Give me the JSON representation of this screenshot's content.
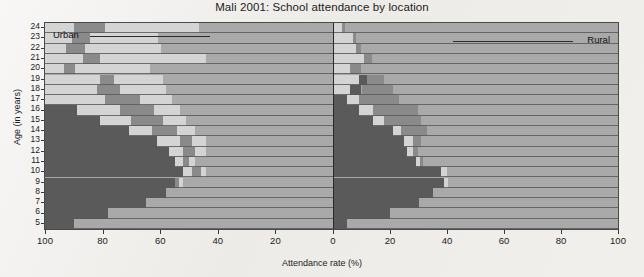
{
  "chart_data": {
    "type": "bar",
    "subtype": "diverging-stacked-bar-pyramid",
    "title": "Mali 2001: School attendance by location",
    "xlabel": "Attendance rate (%)",
    "ylabel": "Age (in years)",
    "grid": false,
    "legend_position": "in-plot-annotation",
    "annotations": [
      {
        "text": "Urban",
        "side": "left"
      },
      {
        "text": "Rural",
        "side": "right"
      }
    ],
    "x_ticks_left": [
      "100",
      "80",
      "60",
      "40",
      "20",
      "0"
    ],
    "x_ticks_right": [
      "0",
      "20",
      "40",
      "60",
      "80",
      "100"
    ],
    "x_tick_values_left": [
      100,
      80,
      60,
      40,
      20,
      0
    ],
    "x_tick_values_right": [
      0,
      20,
      40,
      60,
      80,
      100
    ],
    "xlim_left": [
      0,
      100
    ],
    "xlim_right": [
      0,
      100
    ],
    "categories": [
      "24",
      "23",
      "22",
      "21",
      "20",
      "19",
      "18",
      "17",
      "16",
      "15",
      "14",
      "13",
      "12",
      "11",
      "10",
      "9",
      "8",
      "7",
      "6",
      "5"
    ],
    "series": [
      {
        "name": "never attended",
        "color": "#a9a9a9"
      },
      {
        "name": "left school",
        "color": "#d4d4d4"
      },
      {
        "name": "attending (secondary/other)",
        "color": "#8a8a8a"
      },
      {
        "name": "attending primary",
        "color": "#5a5a5a"
      }
    ],
    "colors": {
      "never_attended": "#a9a9a9",
      "left_school": "#d4d4d4",
      "attending_other": "#8a8a8a",
      "attending_primary": "#5a5a5a",
      "plot_background": "#a9a9a9",
      "axis": "#3a3a3a",
      "page_background": "#efedea"
    },
    "rows": [
      {
        "age": "24",
        "left": [
          {
            "c": "never_attended",
            "v": 46.5
          },
          {
            "c": "left_school",
            "v": 32.6
          },
          {
            "c": "attending_other",
            "v": 10.8
          },
          {
            "c": "attending_primary",
            "v": 0
          },
          {
            "c": "left_school",
            "v": 10.1
          }
        ],
        "right": [
          {
            "c": "left_school",
            "v": 3.3
          },
          {
            "c": "attending_other",
            "v": 1.0
          },
          {
            "c": "never_attended",
            "v": 95.7
          }
        ]
      },
      {
        "age": "23",
        "left": [
          {
            "c": "never_attended",
            "v": 60.8
          },
          {
            "c": "left_school",
            "v": 23.6
          },
          {
            "c": "attending_other",
            "v": 6.3
          },
          {
            "c": "left_school",
            "v": 9.3
          }
        ],
        "right": [
          {
            "c": "left_school",
            "v": 7.0
          },
          {
            "c": "attending_other",
            "v": 1.2
          },
          {
            "c": "never_attended",
            "v": 91.8
          }
        ]
      },
      {
        "age": "22",
        "left": [
          {
            "c": "never_attended",
            "v": 59.7
          },
          {
            "c": "left_school",
            "v": 26.4
          },
          {
            "c": "attending_other",
            "v": 6.6
          },
          {
            "c": "left_school",
            "v": 7.3
          }
        ],
        "right": [
          {
            "c": "left_school",
            "v": 8.0
          },
          {
            "c": "attending_other",
            "v": 2.0
          },
          {
            "c": "never_attended",
            "v": 90.0
          }
        ]
      },
      {
        "age": "21",
        "left": [
          {
            "c": "never_attended",
            "v": 44.1
          },
          {
            "c": "left_school",
            "v": 36.8
          },
          {
            "c": "attending_other",
            "v": 5.9
          },
          {
            "c": "left_school",
            "v": 13.2
          }
        ],
        "right": [
          {
            "c": "left_school",
            "v": 11.0
          },
          {
            "c": "attending_other",
            "v": 2.6
          },
          {
            "c": "never_attended",
            "v": 86.4
          }
        ]
      },
      {
        "age": "20",
        "left": [
          {
            "c": "never_attended",
            "v": 63.5
          },
          {
            "c": "left_school",
            "v": 26.0
          },
          {
            "c": "attending_other",
            "v": 3.8
          },
          {
            "c": "left_school",
            "v": 6.7
          }
        ],
        "right": [
          {
            "c": "left_school",
            "v": 6.0
          },
          {
            "c": "attending_other",
            "v": 4.0
          },
          {
            "c": "never_attended",
            "v": 90.0
          }
        ]
      },
      {
        "age": "19",
        "left": [
          {
            "c": "never_attended",
            "v": 59.0
          },
          {
            "c": "left_school",
            "v": 17.0
          },
          {
            "c": "attending_other",
            "v": 5.0
          },
          {
            "c": "left_school",
            "v": 19.0
          }
        ],
        "right": [
          {
            "c": "left_school",
            "v": 9.0
          },
          {
            "c": "attending_primary",
            "v": 3.0
          },
          {
            "c": "attending_other",
            "v": 6.0
          },
          {
            "c": "never_attended",
            "v": 82.0
          }
        ]
      },
      {
        "age": "18",
        "left": [
          {
            "c": "never_attended",
            "v": 58.0
          },
          {
            "c": "left_school",
            "v": 16.0
          },
          {
            "c": "attending_other",
            "v": 8.0
          },
          {
            "c": "left_school",
            "v": 18.0
          }
        ],
        "right": [
          {
            "c": "left_school",
            "v": 6.0
          },
          {
            "c": "attending_primary",
            "v": 4.0
          },
          {
            "c": "attending_other",
            "v": 11.0
          },
          {
            "c": "never_attended",
            "v": 79.0
          }
        ]
      },
      {
        "age": "17",
        "left": [
          {
            "c": "never_attended",
            "v": 56.0
          },
          {
            "c": "left_school",
            "v": 11.0
          },
          {
            "c": "attending_other",
            "v": 12.0
          },
          {
            "c": "left_school",
            "v": 21.0
          }
        ],
        "right": [
          {
            "c": "attending_primary",
            "v": 5.0
          },
          {
            "c": "left_school",
            "v": 4.0
          },
          {
            "c": "attending_other",
            "v": 14.0
          },
          {
            "c": "never_attended",
            "v": 77.0
          }
        ]
      },
      {
        "age": "16",
        "left": [
          {
            "c": "never_attended",
            "v": 53.0
          },
          {
            "c": "left_school",
            "v": 9.0
          },
          {
            "c": "attending_other",
            "v": 12.0
          },
          {
            "c": "left_school",
            "v": 15.0
          },
          {
            "c": "attending_primary",
            "v": 11.0
          }
        ],
        "right": [
          {
            "c": "attending_primary",
            "v": 9.0
          },
          {
            "c": "left_school",
            "v": 5.0
          },
          {
            "c": "attending_other",
            "v": 16.0
          },
          {
            "c": "never_attended",
            "v": 70.0
          }
        ]
      },
      {
        "age": "15",
        "left": [
          {
            "c": "never_attended",
            "v": 51.0
          },
          {
            "c": "left_school",
            "v": 8.0
          },
          {
            "c": "attending_other",
            "v": 11.0
          },
          {
            "c": "left_school",
            "v": 11.0
          },
          {
            "c": "attending_primary",
            "v": 19.0
          }
        ],
        "right": [
          {
            "c": "attending_primary",
            "v": 14.0
          },
          {
            "c": "left_school",
            "v": 4.0
          },
          {
            "c": "attending_other",
            "v": 13.0
          },
          {
            "c": "never_attended",
            "v": 69.0
          }
        ]
      },
      {
        "age": "14",
        "left": [
          {
            "c": "never_attended",
            "v": 48.0
          },
          {
            "c": "left_school",
            "v": 6.0
          },
          {
            "c": "attending_other",
            "v": 9.0
          },
          {
            "c": "left_school",
            "v": 8.0
          },
          {
            "c": "attending_primary",
            "v": 29.0
          }
        ],
        "right": [
          {
            "c": "attending_primary",
            "v": 21.0
          },
          {
            "c": "left_school",
            "v": 3.0
          },
          {
            "c": "attending_other",
            "v": 9.0
          },
          {
            "c": "never_attended",
            "v": 67.0
          }
        ]
      },
      {
        "age": "13",
        "left": [
          {
            "c": "never_attended",
            "v": 44.0
          },
          {
            "c": "left_school",
            "v": 5.0
          },
          {
            "c": "attending_other",
            "v": 4.0
          },
          {
            "c": "left_school",
            "v": 8.0
          },
          {
            "c": "attending_primary",
            "v": 39.0
          }
        ],
        "right": [
          {
            "c": "attending_primary",
            "v": 25.0
          },
          {
            "c": "left_school",
            "v": 3.0
          },
          {
            "c": "attending_other",
            "v": 3.0
          },
          {
            "c": "never_attended",
            "v": 69.0
          }
        ]
      },
      {
        "age": "12",
        "left": [
          {
            "c": "never_attended",
            "v": 44.0
          },
          {
            "c": "left_school",
            "v": 4.0
          },
          {
            "c": "attending_other",
            "v": 4.0
          },
          {
            "c": "left_school",
            "v": 5.0
          },
          {
            "c": "attending_primary",
            "v": 43.0
          }
        ],
        "right": [
          {
            "c": "attending_primary",
            "v": 26.0
          },
          {
            "c": "left_school",
            "v": 2.0
          },
          {
            "c": "attending_other",
            "v": 2.0
          },
          {
            "c": "never_attended",
            "v": 70.0
          }
        ]
      },
      {
        "age": "11",
        "left": [
          {
            "c": "never_attended",
            "v": 48.0
          },
          {
            "c": "left_school",
            "v": 2.0
          },
          {
            "c": "attending_other",
            "v": 2.0
          },
          {
            "c": "left_school",
            "v": 3.0
          },
          {
            "c": "attending_primary",
            "v": 45.0
          }
        ],
        "right": [
          {
            "c": "attending_primary",
            "v": 29.0
          },
          {
            "c": "left_school",
            "v": 1.5
          },
          {
            "c": "attending_other",
            "v": 1.0
          },
          {
            "c": "never_attended",
            "v": 68.5
          }
        ]
      },
      {
        "age": "10",
        "left": [
          {
            "c": "never_attended",
            "v": 44.0
          },
          {
            "c": "left_school",
            "v": 2.0
          },
          {
            "c": "attending_other",
            "v": 3.0
          },
          {
            "c": "left_school",
            "v": 3.0
          },
          {
            "c": "attending_primary",
            "v": 48.0
          }
        ],
        "right": [
          {
            "c": "attending_primary",
            "v": 38.0
          },
          {
            "c": "left_school",
            "v": 2.0
          },
          {
            "c": "never_attended",
            "v": 60.0
          }
        ]
      },
      {
        "age": "9",
        "left": [
          {
            "c": "never_attended",
            "v": 52.0
          },
          {
            "c": "left_school",
            "v": 1.5
          },
          {
            "c": "attending_other",
            "v": 1.5
          },
          {
            "c": "attending_primary",
            "v": 45.0
          }
        ],
        "right": [
          {
            "c": "attending_primary",
            "v": 39.0
          },
          {
            "c": "left_school",
            "v": 1.5
          },
          {
            "c": "never_attended",
            "v": 59.5
          }
        ]
      },
      {
        "age": "8",
        "left": [
          {
            "c": "never_attended",
            "v": 58.0
          },
          {
            "c": "attending_primary",
            "v": 42.0
          }
        ],
        "right": [
          {
            "c": "attending_primary",
            "v": 35.0
          },
          {
            "c": "never_attended",
            "v": 65.0
          }
        ]
      },
      {
        "age": "7",
        "left": [
          {
            "c": "never_attended",
            "v": 65.0
          },
          {
            "c": "attending_primary",
            "v": 35.0
          }
        ],
        "right": [
          {
            "c": "attending_primary",
            "v": 30.0
          },
          {
            "c": "never_attended",
            "v": 70.0
          }
        ]
      },
      {
        "age": "6",
        "left": [
          {
            "c": "never_attended",
            "v": 78.0
          },
          {
            "c": "attending_primary",
            "v": 22.0
          }
        ],
        "right": [
          {
            "c": "attending_primary",
            "v": 20.0
          },
          {
            "c": "never_attended",
            "v": 80.0
          }
        ]
      },
      {
        "age": "5",
        "left": [
          {
            "c": "never_attended",
            "v": 90.0
          },
          {
            "c": "attending_primary",
            "v": 10.0
          }
        ],
        "right": [
          {
            "c": "attending_primary",
            "v": 5.0
          },
          {
            "c": "never_attended",
            "v": 95.0
          }
        ]
      }
    ]
  }
}
